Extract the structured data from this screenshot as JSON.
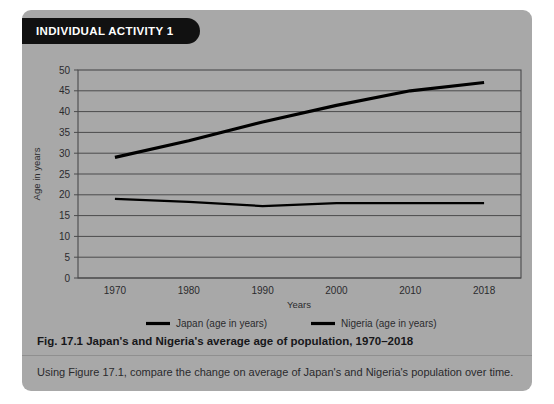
{
  "panel": {
    "banner_label": "INDIVIDUAL ACTIVITY 1",
    "background_color": "#a8a8a8",
    "banner_color": "#111111"
  },
  "figure": {
    "caption": "Fig. 17.1 Japan's and Nigeria's average age of population, 1970–2018",
    "question": "Using Figure 17.1, compare the change on average of Japan's and Nigeria's population over time."
  },
  "chart_data": {
    "type": "line",
    "title": "",
    "xlabel": "Years",
    "ylabel": "Age in years",
    "x": [
      1970,
      1980,
      1990,
      2000,
      2010,
      2018
    ],
    "categories": [
      "1970",
      "1980",
      "1990",
      "2000",
      "2010",
      "2018"
    ],
    "series": [
      {
        "name": "Japan (age in years)",
        "values": [
          29,
          33,
          37.5,
          41.5,
          45,
          47
        ],
        "color": "#000000"
      },
      {
        "name": "Nigeria (age in years)",
        "values": [
          19,
          18.3,
          17.3,
          18,
          18,
          18
        ],
        "color": "#000000"
      }
    ],
    "ylim": [
      0,
      50
    ],
    "y_ticks": [
      0,
      5,
      10,
      15,
      20,
      25,
      30,
      35,
      40,
      45,
      50
    ],
    "y_tick_labels": [
      "0",
      "5",
      "10",
      "15",
      "20",
      "25",
      "30",
      "35",
      "40",
      "45",
      "50"
    ],
    "x_tick_labels": [
      "1970",
      "1980",
      "1990",
      "2000",
      "2010",
      "2018"
    ],
    "grid": true,
    "grid_color": "#4a4a4c",
    "legend_position": "bottom",
    "legend_entries": [
      "Japan (age in years)",
      "Nigeria (age in years)"
    ]
  }
}
